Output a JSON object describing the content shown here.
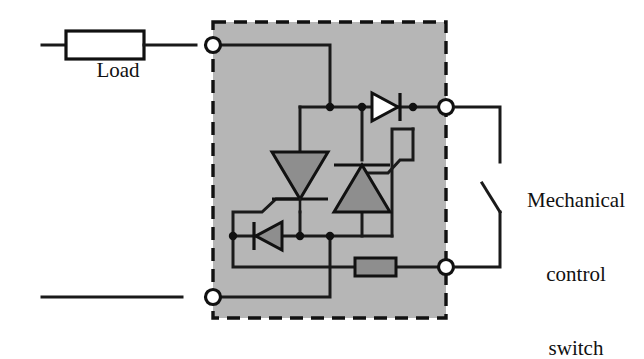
{
  "figure": {
    "type": "circuit-schematic",
    "background_color": "#ffffff",
    "line_color": "#111111",
    "enclosure_fill": "#b6b6b6",
    "device_fill": "#8e8e8e"
  },
  "labels": {
    "load": "Load",
    "mechanical_switch_line1": "Mechanical",
    "mechanical_switch_line2": "control",
    "mechanical_switch_line3": "switch"
  },
  "components": [
    {
      "name": "load-resistor",
      "label": "Load",
      "symbol": "rectangle-resistor",
      "fill": "#ffffff"
    },
    {
      "name": "scr-left",
      "symbol": "thyristor",
      "orientation": "cathode-down",
      "fill": "#8e8e8e"
    },
    {
      "name": "scr-right",
      "symbol": "thyristor",
      "orientation": "cathode-up",
      "fill": "#8e8e8e"
    },
    {
      "name": "diode-top",
      "symbol": "diode",
      "orientation": "anode-left",
      "fill": "#ffffff"
    },
    {
      "name": "diode-bottom",
      "symbol": "diode",
      "orientation": "anode-right",
      "fill": "#8e8e8e"
    },
    {
      "name": "gate-resistor",
      "symbol": "rectangle-resistor",
      "fill": "#8e8e8e"
    },
    {
      "name": "mechanical-control-switch",
      "symbol": "spst-switch",
      "state": "open"
    }
  ],
  "terminals": [
    {
      "name": "terminal-top-left",
      "x": 213,
      "y": 45
    },
    {
      "name": "terminal-bottom-left",
      "x": 213,
      "y": 297
    },
    {
      "name": "terminal-top-right",
      "x": 446,
      "y": 107
    },
    {
      "name": "terminal-bottom-right",
      "x": 446,
      "y": 267
    }
  ],
  "enclosure": {
    "name": "relay-enclosure",
    "style": "dashed",
    "x": 213,
    "y": 22,
    "width": 233,
    "height": 296
  }
}
